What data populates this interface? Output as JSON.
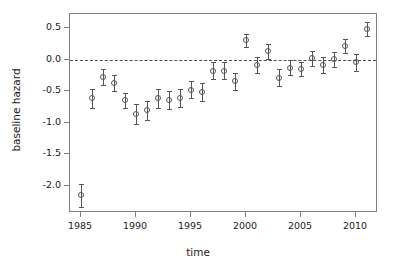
{
  "chart_data": {
    "type": "scatter",
    "title": "",
    "xlabel": "time",
    "ylabel": "baseline hazard",
    "xlim": [
      1984.0,
      2012.0
    ],
    "ylim": [
      -2.43,
      0.73
    ],
    "grid": false,
    "legend": null,
    "reference_lines": [
      {
        "orientation": "horizontal",
        "y": 0.0,
        "style": "dashed"
      }
    ],
    "error_bars": "vertical",
    "marker": "open-circle",
    "xticks": [
      1985,
      1990,
      1995,
      2000,
      2005,
      2010
    ],
    "xticklabels": [
      "1985",
      "1990",
      "1995",
      "2000",
      "2005",
      "2010"
    ],
    "yticks": [
      0.5,
      0.0,
      -0.5,
      -1.0,
      -1.5,
      -2.0
    ],
    "yticklabels": [
      "0.5",
      "0.0",
      "-0.5",
      "-1.0",
      "-1.5",
      "-2.0"
    ],
    "x": [
      1985,
      1986,
      1987,
      1988,
      1989,
      1990,
      1991,
      1992,
      1993,
      1994,
      1995,
      1996,
      1997,
      1998,
      1999,
      2000,
      2001,
      2002,
      2003,
      2004,
      2005,
      2006,
      2007,
      2008,
      2009,
      2010,
      2011
    ],
    "y": [
      -2.15,
      -0.61,
      -0.27,
      -0.37,
      -0.64,
      -0.85,
      -0.8,
      -0.61,
      -0.64,
      -0.6,
      -0.47,
      -0.51,
      -0.17,
      -0.17,
      -0.34,
      0.31,
      -0.08,
      0.14,
      -0.28,
      -0.12,
      -0.15,
      0.03,
      -0.08,
      0.01,
      0.22,
      -0.04,
      0.49
    ],
    "y_lower": [
      -2.33,
      -0.76,
      -0.39,
      -0.5,
      -0.76,
      -1.01,
      -0.95,
      -0.76,
      -0.78,
      -0.74,
      -0.61,
      -0.65,
      -0.31,
      -0.3,
      -0.48,
      0.2,
      -0.2,
      0.02,
      -0.41,
      -0.24,
      -0.26,
      -0.09,
      -0.2,
      -0.11,
      0.11,
      -0.17,
      0.38
    ],
    "y_upper": [
      -1.97,
      -0.46,
      -0.15,
      -0.24,
      -0.52,
      -0.7,
      -0.65,
      -0.46,
      -0.5,
      -0.46,
      -0.33,
      -0.37,
      -0.03,
      -0.04,
      -0.2,
      0.42,
      0.04,
      0.26,
      -0.15,
      0.0,
      -0.04,
      0.15,
      0.04,
      0.13,
      0.33,
      0.09,
      0.6
    ],
    "colors": {
      "marker": "#555555",
      "errorbar": "#555555",
      "axis": "#808080",
      "reference_line": "#4d4d4d",
      "text": "#1a1a1a",
      "background": "#ffffff"
    }
  }
}
